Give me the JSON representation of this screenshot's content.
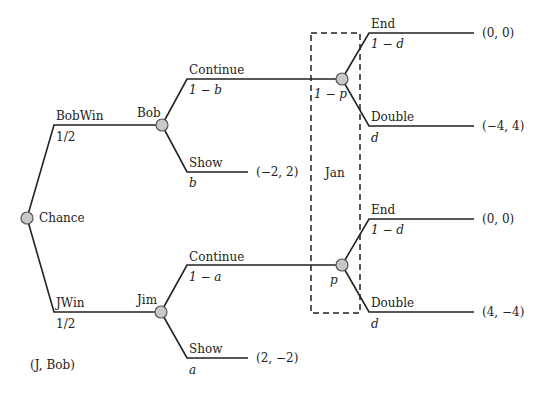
{
  "diagram": {
    "type": "game-tree",
    "nodes": {
      "chance": {
        "label": "Chance"
      },
      "bob": {
        "label": "Bob"
      },
      "jim": {
        "label": "Jim"
      },
      "jan_upper": {
        "prob": "1 − p"
      },
      "jan_lower": {
        "prob": "p"
      }
    },
    "info_set": {
      "label": "Jan"
    },
    "branches": {
      "bobwin": {
        "label": "BobWin",
        "prob": "1/2"
      },
      "jwin": {
        "label": "JWin",
        "prob": "1/2"
      },
      "bob_continue": {
        "label": "Continue",
        "prob": "1 − b"
      },
      "bob_show": {
        "label": "Show",
        "prob": "b",
        "payoff": "(−2, 2)"
      },
      "jim_continue": {
        "label": "Continue",
        "prob": "1 − a"
      },
      "jim_show": {
        "label": "Show",
        "prob": "a",
        "payoff": "(2, −2)"
      },
      "upper_end": {
        "label": "End",
        "prob": "1 − d",
        "payoff": "(0, 0)"
      },
      "upper_double": {
        "label": "Double",
        "prob": "d",
        "payoff": "(−4, 4)"
      },
      "lower_end": {
        "label": "End",
        "prob": "1 − d",
        "payoff": "(0, 0)"
      },
      "lower_double": {
        "label": "Double",
        "prob": "d",
        "payoff": "(4, −4)"
      }
    },
    "legend": "(J, Bob)"
  }
}
